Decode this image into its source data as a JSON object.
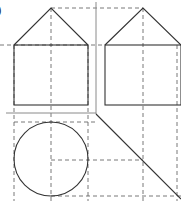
{
  "figure": {
    "label": ")",
    "label_position": {
      "x": -3,
      "y": 14
    },
    "canvas": {
      "width": 181,
      "height": 201,
      "background": "#ffffff"
    },
    "style": {
      "solid_color": "#333333",
      "solid_width": 1.1,
      "dashed_color": "#555555",
      "dashed_width": 0.8,
      "dash_pattern": "4,3",
      "faint_color": "#8a8a8a"
    }
  },
  "shapes": {
    "left_house": {
      "name": "left-house-elevation",
      "rect": {
        "x": 14,
        "y": 45,
        "width": 74,
        "height": 60
      },
      "apex": {
        "x": 51,
        "y": 8
      },
      "roof_points": "14,45 51,8 88,45"
    },
    "right_house": {
      "name": "right-house-elevation",
      "rect": {
        "x": 105,
        "y": 45,
        "width": 76,
        "height": 60
      },
      "apex": {
        "x": 143,
        "y": 8
      },
      "roof_points": "105,45 143,8 181,45"
    },
    "circle_plan": {
      "name": "circle-plan-view",
      "cx": 51,
      "cy": 159,
      "r": 37
    },
    "mitre_line": {
      "name": "forty-five-degree-mitre-line",
      "x1": 96,
      "y1": 114,
      "x2": 181,
      "y2": 199
    },
    "axis_vertical": {
      "name": "vertical-reference-axis",
      "x1": 96,
      "y1": 2,
      "x2": 96,
      "y2": 114
    },
    "axis_horizontal": {
      "name": "horizontal-reference-axis",
      "x1": 6,
      "y1": 113,
      "x2": 96,
      "y2": 113
    }
  },
  "projection_lines": {
    "vertical": [
      {
        "name": "projector-left-edge",
        "x": 14,
        "y1": 45,
        "y2": 201
      },
      {
        "name": "projector-left-centre",
        "x": 51,
        "y1": 8,
        "y2": 201
      },
      {
        "name": "projector-left-right-edge",
        "x": 88,
        "y1": 45,
        "y2": 201
      },
      {
        "name": "projector-right-centre",
        "x": 143,
        "y1": 8,
        "y2": 201
      },
      {
        "name": "projector-right-edge",
        "x": 177,
        "y1": 45,
        "y2": 201
      }
    ],
    "horizontal": [
      {
        "name": "projector-apex-level",
        "y": 8,
        "x1": 51,
        "x2": 143
      },
      {
        "name": "projector-eaves-level",
        "y": 45,
        "x1": 0,
        "x2": 105
      },
      {
        "name": "projector-circle-top",
        "y": 122,
        "x1": 14,
        "x2": 96
      },
      {
        "name": "projector-circle-centre",
        "y": 160,
        "x1": 51,
        "x2": 143
      },
      {
        "name": "projector-circle-bottom",
        "y": 196,
        "x1": 51,
        "x2": 181
      }
    ]
  }
}
